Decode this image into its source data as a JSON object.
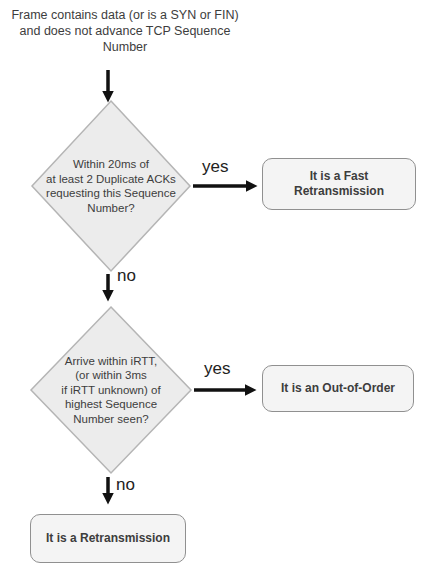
{
  "title": "Frame contains data (or is a SYN or FIN)\nand does not advance TCP Sequence\nNumber",
  "flow": {
    "decision1": {
      "question": "Within 20ms of\nat least 2 Duplicate ACKs\nrequesting this Sequence\nNumber?",
      "yes_label": "yes",
      "no_label": "no"
    },
    "decision2": {
      "question": "Arrive within iRTT,\n(or within 3ms\nif iRTT unknown) of\nhighest Sequence\nNumber seen?",
      "yes_label": "yes",
      "no_label": "no"
    },
    "outcome_fast_retransmission": "It is a Fast\nRetransmission",
    "outcome_out_of_order": "It is an Out-of-Order",
    "outcome_retransmission": "It is a Retransmission"
  },
  "colors": {
    "diamond-fill": "#ececec",
    "diamond-border": "#b5b5b5",
    "box-fill": "#f4f4f4",
    "box-border": "#909090",
    "arrow": "#111111",
    "text": "#3d3d3d",
    "label": "#222222"
  }
}
